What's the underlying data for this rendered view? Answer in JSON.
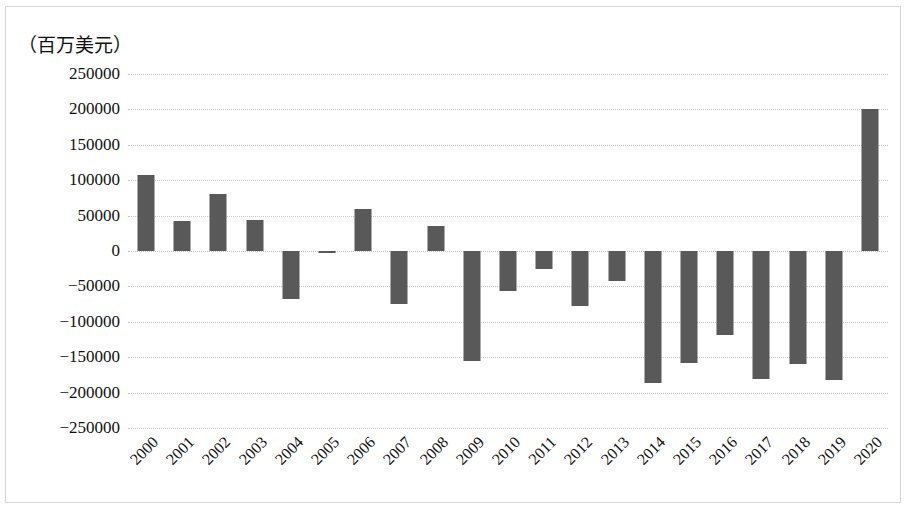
{
  "chart_data": {
    "type": "bar",
    "title": "",
    "subtitle": "",
    "xlabel": "",
    "ylabel": "（百万美元）",
    "unit_caption": "（百万美元）",
    "categories": [
      "2000",
      "2001",
      "2002",
      "2003",
      "2004",
      "2005",
      "2006",
      "2007",
      "2008",
      "2009",
      "2010",
      "2011",
      "2012",
      "2013",
      "2014",
      "2015",
      "2016",
      "2017",
      "2018",
      "2019",
      "2020"
    ],
    "values": [
      107000,
      42000,
      81000,
      44000,
      -68000,
      -3000,
      60000,
      -75000,
      35000,
      -155000,
      -57000,
      -25000,
      -78000,
      -43000,
      -187000,
      -158000,
      -119000,
      -181000,
      -160000,
      -182000,
      200000
    ],
    "series": [
      {
        "name": "",
        "values": [
          107000,
          42000,
          81000,
          44000,
          -68000,
          -3000,
          60000,
          -75000,
          35000,
          -155000,
          -57000,
          -25000,
          -78000,
          -43000,
          -187000,
          -158000,
          -119000,
          -181000,
          -160000,
          -182000,
          200000
        ]
      }
    ],
    "ylim": [
      -250000,
      250000
    ],
    "ytick_step": 50000,
    "ytick_labels": [
      "250000",
      "200000",
      "150000",
      "100000",
      "50000",
      "0",
      "−50000",
      "−100000",
      "−150000",
      "−200000",
      "−250000"
    ],
    "ytick_values": [
      250000,
      200000,
      150000,
      100000,
      50000,
      0,
      -50000,
      -100000,
      -150000,
      -200000,
      -250000
    ],
    "grid": true,
    "grid_style": "dotted",
    "legend": false,
    "legend_position": "none",
    "bar_color": "#595959",
    "gridline_color": "#c9c9c9",
    "axis_text_color": "#111111",
    "background_color": "#ffffff",
    "xtick_rotation_degrees": -45
  }
}
